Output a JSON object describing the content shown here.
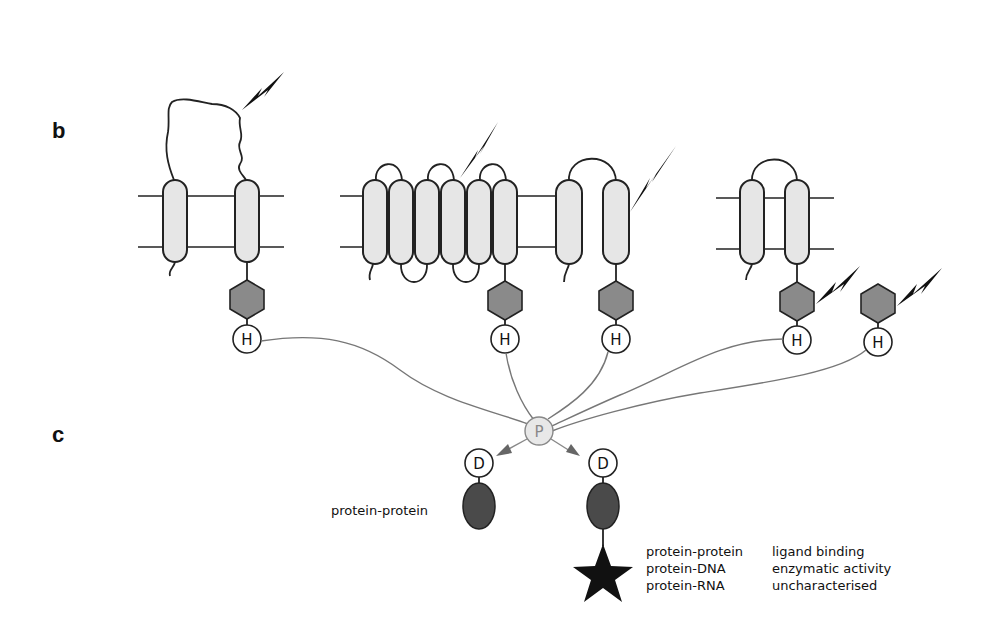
{
  "panels": {
    "b": {
      "label": "b"
    },
    "c": {
      "label": "c"
    }
  },
  "receptors": [
    {
      "type": "two-pass-long-loop",
      "stimulus": "lightning-bolt-on-extracellular-loop"
    },
    {
      "type": "seven-transmembrane",
      "stimulus": "lightning-bolt-on-extracellular-loop"
    },
    {
      "type": "two-pass",
      "stimulus": "lightning-bolt-on-transmembrane-helix"
    },
    {
      "type": "two-pass",
      "stimulus": "lightning-bolt-on-kinase-domain"
    },
    {
      "type": "soluble",
      "stimulus": "lightning-bolt-on-kinase-domain"
    }
  ],
  "nodes": {
    "histidine_label": "H",
    "phosphotransfer_label": "P",
    "receiver_label": "D"
  },
  "outputs": {
    "left": {
      "caption": "protein-protein"
    },
    "right": {
      "interactions": [
        "protein-protein",
        "protein-DNA",
        "protein-RNA"
      ],
      "activities": [
        "ligand binding",
        "enzymatic activity",
        "uncharacterised"
      ]
    }
  },
  "colors": {
    "helix_fill": "#e6e6e6",
    "kinase_fill": "#8a8a8a",
    "output_domain_fill": "#4a4a4a",
    "link_stroke": "#777777",
    "p_node_fill": "#e8e8e8"
  }
}
